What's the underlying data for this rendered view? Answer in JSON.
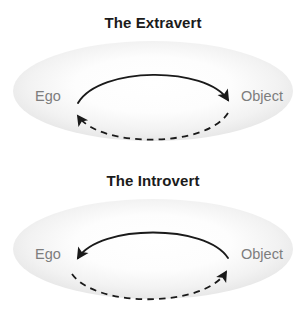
{
  "image": {
    "kind": "conceptual-diagram",
    "background_color": "#ffffff",
    "width": 306,
    "height": 316
  },
  "palette": {
    "title_color": "#1b1b1b",
    "node_label_color": "#7d7d7d",
    "arrow_color": "#1a1a1a",
    "ellipse_edge_color": "#e2e2e2",
    "ellipse_center_color": "#ffffff"
  },
  "panels": [
    {
      "id": "extravert",
      "title": "The Extravert",
      "nodes": {
        "left": "Ego",
        "right": "Object"
      },
      "arrows": [
        {
          "name": "solid-arc-ego-to-object",
          "style": "solid",
          "from": "Ego",
          "to": "Object",
          "curve": "upper"
        },
        {
          "name": "dashed-arc-object-to-ego",
          "style": "dashed",
          "from": "Object",
          "to": "Ego",
          "curve": "lower"
        }
      ]
    },
    {
      "id": "introvert",
      "title": "The Introvert",
      "nodes": {
        "left": "Ego",
        "right": "Object"
      },
      "arrows": [
        {
          "name": "solid-arc-object-to-ego",
          "style": "solid",
          "from": "Object",
          "to": "Ego",
          "curve": "upper"
        },
        {
          "name": "dashed-arc-ego-to-object",
          "style": "dashed",
          "from": "Ego",
          "to": "Object",
          "curve": "lower"
        }
      ]
    }
  ]
}
